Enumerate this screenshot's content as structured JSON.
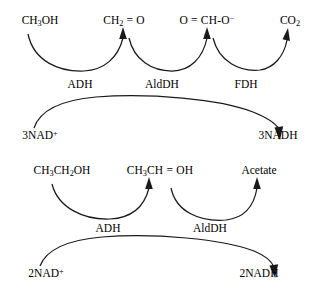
{
  "diagram": {
    "background_color": "#ffffff",
    "stroke_color": "#1a1a1a",
    "pathways": [
      {
        "id": "methanol-pathway",
        "species": [
          {
            "id": "methanol",
            "formula_parts": {
              "pre": "CH",
              "sub1": "3",
              "post": "OH"
            },
            "x": 40,
            "y": 22
          },
          {
            "id": "formaldehyde",
            "formula_parts": {
              "pre": "CH",
              "sub1": "2",
              "post": " = O"
            },
            "x": 120,
            "y": 22
          },
          {
            "id": "formate",
            "formula_parts": {
              "pre": "O = CH-O",
              "sup": "−"
            },
            "x": 202,
            "y": 22
          },
          {
            "id": "carbon-dioxide",
            "formula_parts": {
              "pre": "CO",
              "sub1": "2"
            },
            "x": 290,
            "y": 22
          }
        ],
        "enzymes": [
          {
            "id": "adh-1",
            "label": "ADH",
            "x": 80,
            "y": 84
          },
          {
            "id": "alddh-1",
            "label": "AldDH",
            "x": 160,
            "y": 84
          },
          {
            "id": "fdh-1",
            "label": "FDH",
            "x": 244,
            "y": 84
          }
        ],
        "cofactors": {
          "substrate": {
            "id": "nad-plus-3",
            "pre": "3NAD",
            "sup": "+",
            "x": 38,
            "y": 136
          },
          "product": {
            "id": "nadh-3",
            "label": "3NADH",
            "x": 277,
            "y": 136
          }
        }
      },
      {
        "id": "ethanol-pathway",
        "species": [
          {
            "id": "ethanol",
            "formula_parts": {
              "pre": "CH",
              "sub1": "3",
              "mid": "CH",
              "sub2": "2",
              "post": "OH"
            },
            "x": 60,
            "y": 172
          },
          {
            "id": "acetaldehyde",
            "formula_parts": {
              "pre": "CH",
              "sub1": "3",
              "post": "CH = OH"
            },
            "x": 160,
            "y": 172
          },
          {
            "id": "acetate",
            "formula_parts": {
              "pre": "Acetate"
            },
            "x": 259,
            "y": 172
          }
        ],
        "enzymes": [
          {
            "id": "adh-2",
            "label": "ADH",
            "x": 107,
            "y": 228
          },
          {
            "id": "alddh-2",
            "label": "AldDH",
            "x": 208,
            "y": 228
          }
        ],
        "cofactors": {
          "substrate": {
            "id": "nad-plus-2",
            "pre": "2NAD",
            "sup": "+",
            "x": 45,
            "y": 274
          },
          "product": {
            "id": "nadh-2",
            "label": "2NADH",
            "x": 258,
            "y": 274
          }
        }
      }
    ]
  }
}
